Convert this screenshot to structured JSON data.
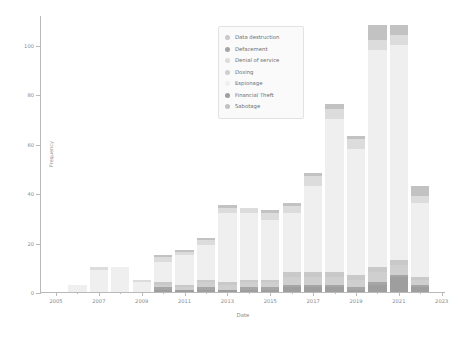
{
  "chart_data": {
    "type": "bar",
    "stacked": true,
    "title": "",
    "xlabel": "Date",
    "ylabel": "Frequency",
    "xlim": [
      2004.3,
      2023.2
    ],
    "ylim": [
      0,
      112
    ],
    "grid": false,
    "legend_position": "upper center",
    "ytick_labels": [
      "0",
      "20",
      "40",
      "60",
      "80",
      "100"
    ],
    "ytick_values": [
      0,
      20,
      40,
      60,
      80,
      100
    ],
    "xtick_labels": [
      "2005",
      "2007",
      "2009",
      "2011",
      "2013",
      "2015",
      "2017",
      "2019",
      "2021",
      "2023"
    ],
    "xtick_values": [
      2005,
      2007,
      2009,
      2011,
      2013,
      2015,
      2017,
      2019,
      2021,
      2023
    ],
    "xtick_minor_values": [
      2006,
      2008,
      2010,
      2012,
      2014,
      2016,
      2018,
      2020,
      2022
    ],
    "categories": [
      2006,
      2007,
      2008,
      2009,
      2010,
      2011,
      2012,
      2013,
      2014,
      2015,
      2016,
      2017,
      2018,
      2019,
      2020,
      2021,
      2022
    ],
    "series": [
      {
        "name": "Data destruction",
        "color": "#c9c9c9",
        "values": [
          0,
          0,
          0,
          0,
          1,
          1,
          1,
          1,
          1,
          1,
          2,
          2,
          2,
          2,
          2,
          2,
          1
        ]
      },
      {
        "name": "Defacement",
        "color": "#a6a6a6",
        "values": [
          0,
          0,
          0,
          0,
          1,
          0,
          1,
          0,
          1,
          1,
          1,
          1,
          1,
          1,
          1,
          1,
          1
        ]
      },
      {
        "name": "Denial of service",
        "color": "#dcdcdc",
        "values": [
          0,
          1,
          0,
          1,
          2,
          1,
          2,
          2,
          2,
          3,
          3,
          4,
          4,
          4,
          4,
          4,
          3
        ]
      },
      {
        "name": "Doxing",
        "color": "#cfcfcf",
        "values": [
          0,
          0,
          0,
          0,
          1,
          1,
          2,
          2,
          2,
          2,
          3,
          3,
          3,
          3,
          4,
          4,
          2
        ]
      },
      {
        "name": "Espionage",
        "color": "#efefef",
        "values": [
          3,
          9,
          10,
          4,
          8,
          12,
          14,
          28,
          27,
          24,
          24,
          35,
          62,
          51,
          88,
          87,
          30
        ]
      },
      {
        "name": "Financial Theft",
        "color": "#9e9e9e",
        "values": [
          0,
          0,
          0,
          0,
          1,
          1,
          1,
          1,
          1,
          1,
          2,
          2,
          2,
          1,
          3,
          6,
          2
        ]
      },
      {
        "name": "Sabotage",
        "color": "#c2c2c2",
        "values": [
          0,
          0,
          0,
          0,
          1,
          1,
          1,
          1,
          0,
          1,
          1,
          1,
          2,
          1,
          6,
          4,
          4
        ]
      }
    ],
    "totals": [
      3,
      10,
      10,
      5,
      15,
      17,
      22,
      35,
      34,
      33,
      36,
      48,
      76,
      63,
      108,
      108,
      43
    ]
  },
  "legend": {
    "items": [
      {
        "label": "Data destruction",
        "color": "#c9c9c9"
      },
      {
        "label": "Defacement",
        "color": "#a6a6a6"
      },
      {
        "label": "Denial of service",
        "color": "#dcdcdc"
      },
      {
        "label": "Doxing",
        "color": "#cfcfcf"
      },
      {
        "label": "Espionage",
        "color": "#efefef"
      },
      {
        "label": "Financial Theft",
        "color": "#9e9e9e"
      },
      {
        "label": "Sabotage",
        "color": "#c2c2c2"
      }
    ]
  }
}
